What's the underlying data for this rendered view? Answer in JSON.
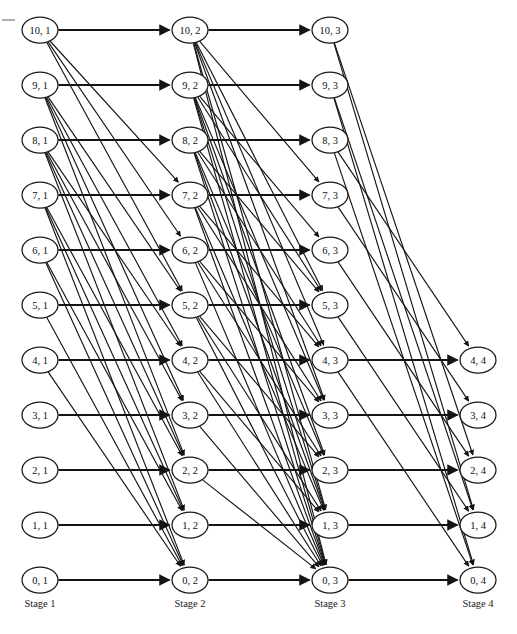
{
  "figure": {
    "type": "trellis-diagram",
    "title": "",
    "corner_mark": "dash-tick"
  },
  "layout": {
    "width": 517,
    "height": 634,
    "stage_x": [
      40,
      190,
      330,
      478
    ],
    "top_y": 30,
    "row_spacing": 55,
    "node_rx": 18,
    "node_ry": 13,
    "label_y": 607
  },
  "colors": {
    "background": "#ffffff",
    "node_stroke": "#1a1a1a",
    "node_fill": "#ffffff",
    "edge": "#141414",
    "text": "#111111"
  },
  "stages": [
    {
      "index": 1,
      "label": "Stage 1",
      "x": 40,
      "nodes": [
        {
          "id": "s1n10",
          "label": "10, 1",
          "level": 10,
          "y": 30
        },
        {
          "id": "s1n9",
          "label": "9, 1",
          "level": 9,
          "y": 85
        },
        {
          "id": "s1n8",
          "label": "8, 1",
          "level": 8,
          "y": 140
        },
        {
          "id": "s1n7",
          "label": "7, 1",
          "level": 7,
          "y": 195
        },
        {
          "id": "s1n6",
          "label": "6, 1",
          "level": 6,
          "y": 250
        },
        {
          "id": "s1n5",
          "label": "5, 1",
          "level": 5,
          "y": 305
        },
        {
          "id": "s1n4",
          "label": "4, 1",
          "level": 4,
          "y": 360
        },
        {
          "id": "s1n3",
          "label": "3, 1",
          "level": 3,
          "y": 415
        },
        {
          "id": "s1n2",
          "label": "2, 1",
          "level": 2,
          "y": 470
        },
        {
          "id": "s1n1",
          "label": "1, 1",
          "level": 1,
          "y": 525
        },
        {
          "id": "s1n0",
          "label": "0, 1",
          "level": 0,
          "y": 580
        }
      ]
    },
    {
      "index": 2,
      "label": "Stage 2",
      "x": 190,
      "nodes": [
        {
          "id": "s2n10",
          "label": "10, 2",
          "level": 10,
          "y": 30
        },
        {
          "id": "s2n9",
          "label": "9, 2",
          "level": 9,
          "y": 85
        },
        {
          "id": "s2n8",
          "label": "8, 2",
          "level": 8,
          "y": 140
        },
        {
          "id": "s2n7",
          "label": "7, 2",
          "level": 7,
          "y": 195
        },
        {
          "id": "s2n6",
          "label": "6, 2",
          "level": 6,
          "y": 250
        },
        {
          "id": "s2n5",
          "label": "5, 2",
          "level": 5,
          "y": 305
        },
        {
          "id": "s2n4",
          "label": "4, 2",
          "level": 4,
          "y": 360
        },
        {
          "id": "s2n3",
          "label": "3, 2",
          "level": 3,
          "y": 415
        },
        {
          "id": "s2n2",
          "label": "2, 2",
          "level": 2,
          "y": 470
        },
        {
          "id": "s2n1",
          "label": "1, 2",
          "level": 1,
          "y": 525
        },
        {
          "id": "s2n0",
          "label": "0, 2",
          "level": 0,
          "y": 580
        }
      ]
    },
    {
      "index": 3,
      "label": "Stage 3",
      "x": 330,
      "nodes": [
        {
          "id": "s3n10",
          "label": "10, 3",
          "level": 10,
          "y": 30
        },
        {
          "id": "s3n9",
          "label": "9, 3",
          "level": 9,
          "y": 85
        },
        {
          "id": "s3n8",
          "label": "8, 3",
          "level": 8,
          "y": 140
        },
        {
          "id": "s3n7",
          "label": "7, 3",
          "level": 7,
          "y": 195
        },
        {
          "id": "s3n6",
          "label": "6, 3",
          "level": 6,
          "y": 250
        },
        {
          "id": "s3n5",
          "label": "5, 3",
          "level": 5,
          "y": 305
        },
        {
          "id": "s3n4",
          "label": "4, 3",
          "level": 4,
          "y": 360
        },
        {
          "id": "s3n3",
          "label": "3, 3",
          "level": 3,
          "y": 415
        },
        {
          "id": "s3n2",
          "label": "2, 3",
          "level": 2,
          "y": 470
        },
        {
          "id": "s3n1",
          "label": "1, 3",
          "level": 1,
          "y": 525
        },
        {
          "id": "s3n0",
          "label": "0, 3",
          "level": 0,
          "y": 580
        }
      ]
    },
    {
      "index": 4,
      "label": "Stage 4",
      "x": 478,
      "nodes": [
        {
          "id": "s4n4",
          "label": "4, 4",
          "level": 4,
          "y": 360
        },
        {
          "id": "s4n3",
          "label": "3, 4",
          "level": 3,
          "y": 415
        },
        {
          "id": "s4n2",
          "label": "2, 4",
          "level": 2,
          "y": 470
        },
        {
          "id": "s4n1",
          "label": "1, 4",
          "level": 1,
          "y": 525
        },
        {
          "id": "s4n0",
          "label": "0, 4",
          "level": 0,
          "y": 580
        }
      ]
    }
  ],
  "edges": {
    "stage1_to_stage2": [
      {
        "from": "s1n10",
        "to": "s2n10",
        "kind": "horizontal"
      },
      {
        "from": "s1n10",
        "to": "s2n7",
        "kind": "diagonal"
      },
      {
        "from": "s1n10",
        "to": "s2n6",
        "kind": "diagonal"
      },
      {
        "from": "s1n10",
        "to": "s2n5",
        "kind": "diagonal"
      },
      {
        "from": "s1n9",
        "to": "s2n9",
        "kind": "horizontal"
      },
      {
        "from": "s1n9",
        "to": "s2n5",
        "kind": "diagonal"
      },
      {
        "from": "s1n9",
        "to": "s2n4",
        "kind": "diagonal"
      },
      {
        "from": "s1n9",
        "to": "s2n3",
        "kind": "diagonal"
      },
      {
        "from": "s1n9",
        "to": "s2n2",
        "kind": "diagonal"
      },
      {
        "from": "s1n8",
        "to": "s2n8",
        "kind": "horizontal"
      },
      {
        "from": "s1n8",
        "to": "s2n4",
        "kind": "diagonal"
      },
      {
        "from": "s1n8",
        "to": "s2n3",
        "kind": "diagonal"
      },
      {
        "from": "s1n8",
        "to": "s2n2",
        "kind": "diagonal"
      },
      {
        "from": "s1n8",
        "to": "s2n1",
        "kind": "diagonal"
      },
      {
        "from": "s1n7",
        "to": "s2n7",
        "kind": "horizontal"
      },
      {
        "from": "s1n7",
        "to": "s2n2",
        "kind": "diagonal"
      },
      {
        "from": "s1n7",
        "to": "s2n1",
        "kind": "diagonal"
      },
      {
        "from": "s1n7",
        "to": "s2n0",
        "kind": "diagonal"
      },
      {
        "from": "s1n6",
        "to": "s2n6",
        "kind": "horizontal"
      },
      {
        "from": "s1n6",
        "to": "s2n1",
        "kind": "diagonal"
      },
      {
        "from": "s1n6",
        "to": "s2n0",
        "kind": "diagonal"
      },
      {
        "from": "s1n5",
        "to": "s2n5",
        "kind": "horizontal"
      },
      {
        "from": "s1n5",
        "to": "s2n0",
        "kind": "diagonal"
      },
      {
        "from": "s1n4",
        "to": "s2n4",
        "kind": "horizontal"
      },
      {
        "from": "s1n4",
        "to": "s2n0",
        "kind": "diagonal"
      },
      {
        "from": "s1n3",
        "to": "s2n3",
        "kind": "horizontal"
      },
      {
        "from": "s1n2",
        "to": "s2n2",
        "kind": "horizontal"
      },
      {
        "from": "s1n1",
        "to": "s2n1",
        "kind": "horizontal"
      },
      {
        "from": "s1n0",
        "to": "s2n0",
        "kind": "horizontal"
      }
    ],
    "stage2_to_stage3": [
      {
        "from": "s2n10",
        "to": "s3n10",
        "kind": "horizontal"
      },
      {
        "from": "s2n10",
        "to": "s3n7",
        "kind": "diagonal"
      },
      {
        "from": "s2n10",
        "to": "s3n5",
        "kind": "diagonal"
      },
      {
        "from": "s2n10",
        "to": "s3n4",
        "kind": "diagonal"
      },
      {
        "from": "s2n10",
        "to": "s3n3",
        "kind": "diagonal"
      },
      {
        "from": "s2n10",
        "to": "s3n1",
        "kind": "diagonal"
      },
      {
        "from": "s2n10",
        "to": "s3n0",
        "kind": "diagonal"
      },
      {
        "from": "s2n9",
        "to": "s3n9",
        "kind": "horizontal"
      },
      {
        "from": "s2n9",
        "to": "s3n6",
        "kind": "diagonal"
      },
      {
        "from": "s2n9",
        "to": "s3n5",
        "kind": "diagonal"
      },
      {
        "from": "s2n9",
        "to": "s3n3",
        "kind": "diagonal"
      },
      {
        "from": "s2n9",
        "to": "s3n2",
        "kind": "diagonal"
      },
      {
        "from": "s2n9",
        "to": "s3n1",
        "kind": "diagonal"
      },
      {
        "from": "s2n9",
        "to": "s3n0",
        "kind": "diagonal"
      },
      {
        "from": "s2n8",
        "to": "s3n8",
        "kind": "horizontal"
      },
      {
        "from": "s2n8",
        "to": "s3n5",
        "kind": "diagonal"
      },
      {
        "from": "s2n8",
        "to": "s3n4",
        "kind": "diagonal"
      },
      {
        "from": "s2n8",
        "to": "s3n2",
        "kind": "diagonal"
      },
      {
        "from": "s2n8",
        "to": "s3n1",
        "kind": "diagonal"
      },
      {
        "from": "s2n8",
        "to": "s3n0",
        "kind": "diagonal"
      },
      {
        "from": "s2n7",
        "to": "s3n7",
        "kind": "horizontal"
      },
      {
        "from": "s2n7",
        "to": "s3n4",
        "kind": "diagonal"
      },
      {
        "from": "s2n7",
        "to": "s3n3",
        "kind": "diagonal"
      },
      {
        "from": "s2n7",
        "to": "s3n1",
        "kind": "diagonal"
      },
      {
        "from": "s2n7",
        "to": "s3n0",
        "kind": "diagonal"
      },
      {
        "from": "s2n6",
        "to": "s3n6",
        "kind": "horizontal"
      },
      {
        "from": "s2n6",
        "to": "s3n3",
        "kind": "diagonal"
      },
      {
        "from": "s2n6",
        "to": "s3n2",
        "kind": "diagonal"
      },
      {
        "from": "s2n6",
        "to": "s3n0",
        "kind": "diagonal"
      },
      {
        "from": "s2n5",
        "to": "s3n5",
        "kind": "horizontal"
      },
      {
        "from": "s2n5",
        "to": "s3n2",
        "kind": "diagonal"
      },
      {
        "from": "s2n5",
        "to": "s3n1",
        "kind": "diagonal"
      },
      {
        "from": "s2n5",
        "to": "s3n0",
        "kind": "diagonal"
      },
      {
        "from": "s2n4",
        "to": "s3n4",
        "kind": "horizontal"
      },
      {
        "from": "s2n4",
        "to": "s3n1",
        "kind": "diagonal"
      },
      {
        "from": "s2n4",
        "to": "s3n0",
        "kind": "diagonal"
      },
      {
        "from": "s2n3",
        "to": "s3n3",
        "kind": "horizontal"
      },
      {
        "from": "s2n3",
        "to": "s3n0",
        "kind": "diagonal"
      },
      {
        "from": "s2n2",
        "to": "s3n2",
        "kind": "horizontal"
      },
      {
        "from": "s2n2",
        "to": "s3n0",
        "kind": "diagonal"
      },
      {
        "from": "s2n1",
        "to": "s3n1",
        "kind": "horizontal"
      },
      {
        "from": "s2n0",
        "to": "s3n0",
        "kind": "horizontal"
      }
    ],
    "stage3_to_stage4": [
      {
        "from": "s3n10",
        "to": "s4n2",
        "kind": "diagonal"
      },
      {
        "from": "s3n10",
        "to": "s4n1",
        "kind": "diagonal"
      },
      {
        "from": "s3n9",
        "to": "s4n1",
        "kind": "diagonal"
      },
      {
        "from": "s3n9",
        "to": "s4n0",
        "kind": "diagonal"
      },
      {
        "from": "s3n8",
        "to": "s4n4",
        "kind": "diagonal"
      },
      {
        "from": "s3n8",
        "to": "s4n0",
        "kind": "diagonal"
      },
      {
        "from": "s3n7",
        "to": "s4n3",
        "kind": "diagonal"
      },
      {
        "from": "s3n6",
        "to": "s4n2",
        "kind": "diagonal"
      },
      {
        "from": "s3n5",
        "to": "s4n1",
        "kind": "diagonal"
      },
      {
        "from": "s3n4",
        "to": "s4n4",
        "kind": "horizontal"
      },
      {
        "from": "s3n4",
        "to": "s4n0",
        "kind": "diagonal"
      },
      {
        "from": "s3n3",
        "to": "s4n3",
        "kind": "horizontal"
      },
      {
        "from": "s3n2",
        "to": "s4n2",
        "kind": "horizontal"
      },
      {
        "from": "s3n1",
        "to": "s4n1",
        "kind": "horizontal"
      },
      {
        "from": "s3n0",
        "to": "s4n0",
        "kind": "horizontal"
      }
    ]
  }
}
